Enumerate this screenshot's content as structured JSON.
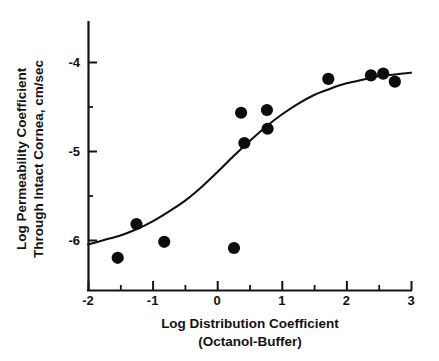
{
  "chart_data": {
    "type": "scatter",
    "title": "",
    "xlabel": "Log Distribution Coefficient",
    "xlabel_line2": "(Octanol-Buffer)",
    "ylabel": "Log Permeability Coefficient",
    "ylabel_line2": "Through Intact Cornea, cm/sec",
    "xlim": [
      -2,
      3
    ],
    "ylim": [
      -6.62,
      -3.72
    ],
    "xticks": [
      -2,
      -1,
      0,
      1,
      2,
      3
    ],
    "xtick_labels": [
      "-2",
      "-1",
      "0",
      "1",
      "2",
      "3"
    ],
    "xminor_ticks": [
      -1.5,
      -0.5,
      0.5,
      1.5,
      2.5
    ],
    "yticks": [
      -4,
      -5,
      -6
    ],
    "ytick_labels": [
      "-4",
      "-5",
      "-6"
    ],
    "yminor_ticks": [
      -4.5,
      -5.5
    ],
    "grid": false,
    "legend": null,
    "marker": "filled-circle",
    "marker_color": "#0d0d0d",
    "curve_color": "#101010",
    "points": [
      {
        "x": -1.54,
        "y": -6.2
      },
      {
        "x": -1.25,
        "y": -5.82
      },
      {
        "x": -0.82,
        "y": -6.02
      },
      {
        "x": 0.26,
        "y": -6.09
      },
      {
        "x": 0.37,
        "y": -4.57
      },
      {
        "x": 0.42,
        "y": -4.91
      },
      {
        "x": 0.77,
        "y": -4.54
      },
      {
        "x": 0.78,
        "y": -4.75
      },
      {
        "x": 1.72,
        "y": -4.19
      },
      {
        "x": 2.38,
        "y": -4.15
      },
      {
        "x": 2.57,
        "y": -4.13
      },
      {
        "x": 2.75,
        "y": -4.22
      }
    ],
    "fit_curve": {
      "name": "sigmoid-fit",
      "points": [
        {
          "x": -2.0,
          "y": -6.05
        },
        {
          "x": -1.75,
          "y": -6.0
        },
        {
          "x": -1.5,
          "y": -5.95
        },
        {
          "x": -1.25,
          "y": -5.88
        },
        {
          "x": -1.0,
          "y": -5.79
        },
        {
          "x": -0.75,
          "y": -5.68
        },
        {
          "x": -0.5,
          "y": -5.56
        },
        {
          "x": -0.25,
          "y": -5.41
        },
        {
          "x": 0.0,
          "y": -5.24
        },
        {
          "x": 0.25,
          "y": -5.06
        },
        {
          "x": 0.5,
          "y": -4.89
        },
        {
          "x": 0.75,
          "y": -4.73
        },
        {
          "x": 1.0,
          "y": -4.59
        },
        {
          "x": 1.25,
          "y": -4.47
        },
        {
          "x": 1.5,
          "y": -4.37
        },
        {
          "x": 1.75,
          "y": -4.3
        },
        {
          "x": 2.0,
          "y": -4.24
        },
        {
          "x": 2.25,
          "y": -4.2
        },
        {
          "x": 2.5,
          "y": -4.16
        },
        {
          "x": 2.75,
          "y": -4.14
        },
        {
          "x": 3.0,
          "y": -4.12
        }
      ]
    }
  },
  "axes": {
    "x_tick_labels": [
      "-2",
      "-1",
      "0",
      "1",
      "2",
      "3"
    ],
    "y_tick_labels": [
      "-4",
      "-5",
      "-6"
    ],
    "x_title_line1": "Log Distribution Coefficient",
    "x_title_line2": "(Octanol-Buffer)",
    "y_title_line1": "Log Permeability Coefficient",
    "y_title_line2": "Through Intact Cornea, cm/sec"
  }
}
